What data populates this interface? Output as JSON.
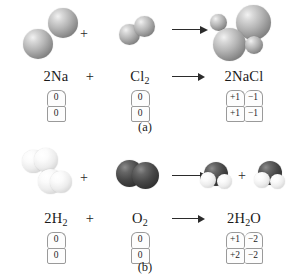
{
  "figure": {
    "panels": [
      {
        "id": "a",
        "caption": "(a)",
        "equation": {
          "reactant1": "2Na",
          "plus": "+",
          "reactant2": "Cl",
          "reactant2_sub": "2",
          "arrow": "→",
          "product": "2NaCl"
        },
        "oxidation_numbers": {
          "reactant1": {
            "top": [
              "0"
            ],
            "bottom": [
              "0"
            ]
          },
          "reactant2": {
            "top": [
              "0"
            ],
            "bottom": [
              "0"
            ]
          },
          "product": {
            "top": [
              "+1",
              "−1"
            ],
            "bottom": [
              "+1",
              "−1"
            ]
          }
        },
        "models": {
          "reactant1_name": "two-sodium-atom-spheres",
          "reactant2_name": "chlorine-molecule-spheres",
          "product_name": "sodium-chloride-cluster-spheres"
        }
      },
      {
        "id": "b",
        "caption": "(b)",
        "equation": {
          "reactant1": "2H",
          "reactant1_sub": "2",
          "plus": "+",
          "reactant2": "O",
          "reactant2_sub": "2",
          "arrow": "→",
          "product": "2H",
          "product_sub": "2",
          "product_tail": "O"
        },
        "oxidation_numbers": {
          "reactant1": {
            "top": [
              "0"
            ],
            "bottom": [
              "0"
            ]
          },
          "reactant2": {
            "top": [
              "0"
            ],
            "bottom": [
              "0"
            ]
          },
          "product": {
            "top": [
              "+1",
              "−2"
            ],
            "bottom": [
              "+2",
              "−2"
            ]
          }
        },
        "models": {
          "reactant1_name": "two-hydrogen-molecule-spheres",
          "reactant2_name": "oxygen-molecule-spheres",
          "product_name": "two-water-molecule-spheres",
          "product_plus": "+"
        }
      }
    ],
    "colors": {
      "sodium_chlorine_grey": "#b5b5b5",
      "hydrogen_white": "#ededed",
      "oxygen_dark": "#474747",
      "text": "#1a1a1a",
      "box_border": "#9a9a9a"
    }
  }
}
